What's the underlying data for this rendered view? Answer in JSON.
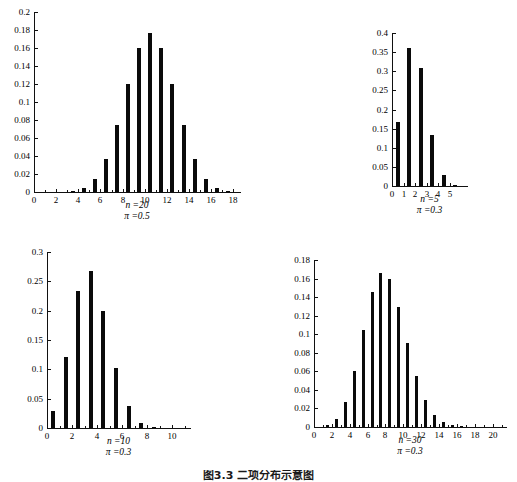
{
  "figure": {
    "caption": "图3.3 二项分布示意图"
  },
  "chart_data": [
    {
      "id": "panel-n20-p05",
      "type": "bar",
      "title": "",
      "caption_lines": [
        "n =20",
        "π =0.5"
      ],
      "n": 20,
      "pi": 0.5,
      "xlabel": "",
      "ylabel": "",
      "grid": false,
      "legend": "none",
      "xlim": [
        0,
        18.6
      ],
      "ylim": [
        0,
        0.2
      ],
      "xticks": [
        0,
        2,
        4,
        6,
        8,
        10,
        12,
        14,
        16,
        18
      ],
      "xticklabels": [
        "0",
        "2",
        "4",
        "6",
        "8",
        "10",
        "12",
        "14",
        "16",
        "18"
      ],
      "yticks": [
        0,
        0.02,
        0.04,
        0.06,
        0.08,
        0.1,
        0.12,
        0.14,
        0.16,
        0.18,
        0.2
      ],
      "yticklabels": [
        "0",
        "0.02",
        "0.04",
        "0.06",
        "0.08",
        "0.1",
        "0.12",
        "0.14",
        "0.16",
        "0.18",
        "0.2"
      ],
      "categories": [
        0,
        1,
        2,
        3,
        4,
        5,
        6,
        7,
        8,
        9,
        10,
        11,
        12,
        13,
        14,
        15,
        16,
        17,
        18
      ],
      "values": [
        1e-06,
        2e-05,
        0.0002,
        0.0011,
        0.0046,
        0.0148,
        0.037,
        0.0739,
        0.1201,
        0.1602,
        0.1762,
        0.1602,
        0.1201,
        0.0739,
        0.037,
        0.0148,
        0.0046,
        0.0011,
        0.0002
      ]
    },
    {
      "id": "panel-n5-p03",
      "type": "bar",
      "title": "",
      "caption_lines": [
        "n =5",
        "π =0.3"
      ],
      "n": 5,
      "pi": 0.3,
      "xlabel": "",
      "ylabel": "",
      "grid": false,
      "legend": "none",
      "xlim": [
        0,
        6.5
      ],
      "ylim": [
        0,
        0.4
      ],
      "xticks": [
        0,
        1,
        2,
        3,
        4,
        5
      ],
      "xticklabels": [
        "0",
        "1",
        "2",
        "3",
        "4",
        "5"
      ],
      "yticks": [
        0,
        0.05,
        0.1,
        0.15,
        0.2,
        0.25,
        0.3,
        0.35,
        0.4
      ],
      "yticklabels": [
        "0",
        "0.05",
        "0.1",
        "0.15",
        "0.2",
        "0.25",
        "0.3",
        "0.35",
        "0.4"
      ],
      "categories": [
        0,
        1,
        2,
        3,
        4,
        5
      ],
      "values": [
        0.1681,
        0.3602,
        0.3087,
        0.1323,
        0.0284,
        0.0024
      ]
    },
    {
      "id": "panel-n10-p03",
      "type": "bar",
      "title": "",
      "caption_lines": [
        "n =10",
        "π =0.3"
      ],
      "n": 10,
      "pi": 0.3,
      "xlabel": "",
      "ylabel": "",
      "grid": false,
      "legend": "none",
      "xlim": [
        0,
        11.4
      ],
      "ylim": [
        0,
        0.3
      ],
      "xticks": [
        0,
        2,
        4,
        6,
        8,
        10
      ],
      "xticklabels": [
        "0",
        "2",
        "4",
        "6",
        "8",
        "10"
      ],
      "yticks": [
        0,
        0.05,
        0.1,
        0.15,
        0.2,
        0.25,
        0.3
      ],
      "yticklabels": [
        "0",
        "0.05",
        "0.1",
        "0.15",
        "0.2",
        "0.25",
        "0.3"
      ],
      "categories": [
        0,
        1,
        2,
        3,
        4,
        5,
        6,
        7,
        8,
        9,
        10
      ],
      "values": [
        0.0282,
        0.1211,
        0.2335,
        0.2668,
        0.2001,
        0.1029,
        0.0368,
        0.009,
        0.0014,
        0.0001,
        5.9e-06
      ]
    },
    {
      "id": "panel-n30-p03",
      "type": "bar",
      "title": "",
      "caption_lines": [
        "n =30",
        "π =0.3"
      ],
      "n": 30,
      "pi": 0.3,
      "xlabel": "",
      "ylabel": "",
      "grid": false,
      "legend": "none",
      "xlim": [
        0,
        21.5
      ],
      "ylim": [
        0,
        0.18
      ],
      "xticks": [
        0,
        2,
        4,
        6,
        8,
        10,
        12,
        14,
        16,
        18,
        20
      ],
      "xticklabels": [
        "0",
        "2",
        "4",
        "6",
        "8",
        "10",
        "12",
        "14",
        "16",
        "18",
        "20"
      ],
      "yticks": [
        0,
        0.02,
        0.04,
        0.06,
        0.08,
        0.1,
        0.12,
        0.14,
        0.16,
        0.18
      ],
      "yticklabels": [
        "0",
        "0.02",
        "0.04",
        "0.06",
        "0.08",
        "0.1",
        "0.12",
        "0.14",
        "0.16",
        "0.18"
      ],
      "categories": [
        0,
        1,
        2,
        3,
        4,
        5,
        6,
        7,
        8,
        9,
        10,
        11,
        12,
        13,
        14,
        15,
        16,
        17,
        18,
        19,
        20,
        21
      ],
      "values": [
        0.0002,
        0.0018,
        0.0086,
        0.0269,
        0.0604,
        0.1047,
        0.1455,
        0.1662,
        0.1593,
        0.1298,
        0.0909,
        0.0551,
        0.0291,
        0.0134,
        0.0054,
        0.0019,
        0.0006,
        0.0002,
        4e-05,
        9e-06,
        2e-06,
        3e-07
      ]
    }
  ],
  "panel_geometry": [
    {
      "left": 6,
      "top": 4,
      "width": 244,
      "height": 232,
      "plot_left": 34,
      "plot_top": 12,
      "plot_right": 240,
      "plot_bottom": 192,
      "caption_top": 200
    },
    {
      "left": 360,
      "top": 22,
      "width": 150,
      "height": 215,
      "plot_left": 392,
      "plot_top": 33,
      "plot_right": 467,
      "plot_bottom": 186,
      "caption_top": 194
    },
    {
      "left": 18,
      "top": 242,
      "width": 200,
      "height": 225,
      "plot_left": 47,
      "plot_top": 252,
      "plot_right": 190,
      "plot_bottom": 428,
      "caption_top": 436
    },
    {
      "left": 258,
      "top": 252,
      "width": 256,
      "height": 215,
      "plot_left": 314,
      "plot_top": 260,
      "plot_right": 506,
      "plot_bottom": 427,
      "caption_top": 435
    }
  ]
}
